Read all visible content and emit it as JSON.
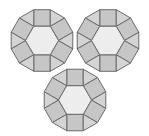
{
  "diagram": {
    "title": "",
    "side_length": 16.5,
    "colors": {
      "square": "#c6c6c6",
      "triangle": "#d4d4d4",
      "hexagon": "#ededed",
      "stroke": "#6a6a6a",
      "background": "#ffffff"
    },
    "dodecagons": [
      {
        "name": "top-left",
        "cx": 42,
        "cy": 40.5
      },
      {
        "name": "top-right",
        "cx": 108,
        "cy": 40.5
      },
      {
        "name": "bottom",
        "cx": 75,
        "cy": 100
      }
    ]
  }
}
